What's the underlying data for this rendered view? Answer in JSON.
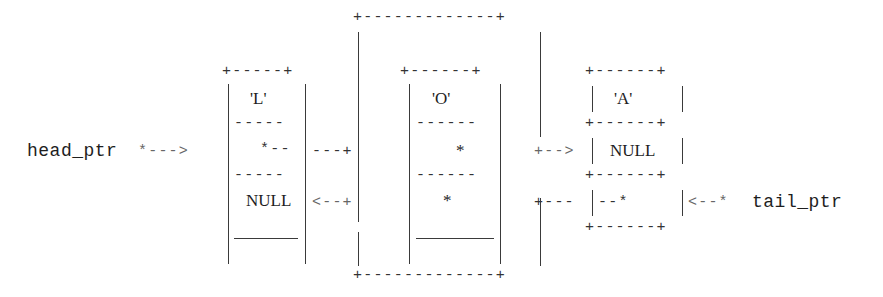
{
  "diagram": {
    "type": "doubly-linked-list",
    "head_label": "head_ptr",
    "head_arrow": "*--->",
    "tail_label": "tail_ptr",
    "tail_arrow": "<--*",
    "nodes": [
      {
        "data": "'L'",
        "next": "*--",
        "prev": "NULL"
      },
      {
        "data": "'O'",
        "next": "*",
        "prev": "*"
      },
      {
        "data": "'A'",
        "next": "NULL",
        "prev": "--*"
      }
    ],
    "connectors": {
      "l_to_o": "---+",
      "o_back_to_l": "<--+",
      "o_to_a": "+-->",
      "a_back_to_o": "+---"
    },
    "outer_loop_top": "+-------------+",
    "outer_loop_bottom": "+-------------+",
    "box_top": "+-----+",
    "box_top_wide": "+------+",
    "divider": "-----",
    "divider_wide": "------"
  }
}
